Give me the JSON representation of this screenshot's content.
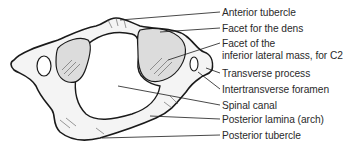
{
  "figure": {
    "labels": [
      {
        "id": "anterior-tubercle",
        "text": "Anterior tubercle",
        "top": 7
      },
      {
        "id": "facet-for-dens",
        "text": "Facet for the dens",
        "top": 23
      },
      {
        "id": "facet-inferior-line1",
        "text": "Facet of the",
        "top": 38
      },
      {
        "id": "facet-inferior-line2",
        "text": "inferior lateral mass, for C2",
        "top": 50
      },
      {
        "id": "transverse-process",
        "text": "Transverse process",
        "top": 68
      },
      {
        "id": "intertransverse-foramen",
        "text": "Intertransverse foramen",
        "top": 84
      },
      {
        "id": "spinal-canal",
        "text": "Spinal canal",
        "top": 100
      },
      {
        "id": "posterior-lamina",
        "text": "Posterior lamina (arch)",
        "top": 114
      },
      {
        "id": "posterior-tubercle",
        "text": "Posterior tubercle",
        "top": 130
      }
    ],
    "colors": {
      "line": "#1a1a1a",
      "bone_fill": "#f4f4f4",
      "facet_fill": "#dcdcdc",
      "text": "#2a2a2a"
    }
  }
}
